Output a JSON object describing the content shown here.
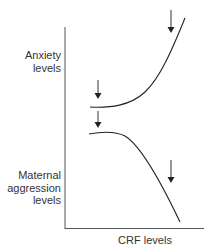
{
  "diagram": {
    "y_labels": {
      "upper": [
        "Anxiety",
        "levels"
      ],
      "lower": [
        "Maternal",
        "aggression",
        "levels"
      ]
    },
    "x_label": "CRF levels",
    "curves": [
      {
        "name": "anxiety",
        "shape": "flat then sharply increasing"
      },
      {
        "name": "maternal-aggression",
        "shape": "flat then sharply decreasing"
      }
    ],
    "arrows": 4,
    "line_color": "#222222"
  }
}
